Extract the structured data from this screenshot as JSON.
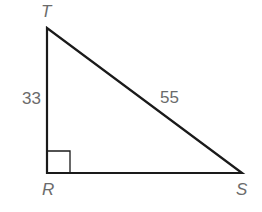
{
  "diagram": {
    "type": "right-triangle",
    "vertices": [
      {
        "name": "T",
        "label": "T"
      },
      {
        "name": "R",
        "label": "R"
      },
      {
        "name": "S",
        "label": "S"
      }
    ],
    "sides": {
      "TR": "33",
      "TS": "55"
    },
    "right_angle_at": "R",
    "colors": {
      "stroke": "#1a1a1a",
      "label": "#6b6b6b"
    }
  }
}
